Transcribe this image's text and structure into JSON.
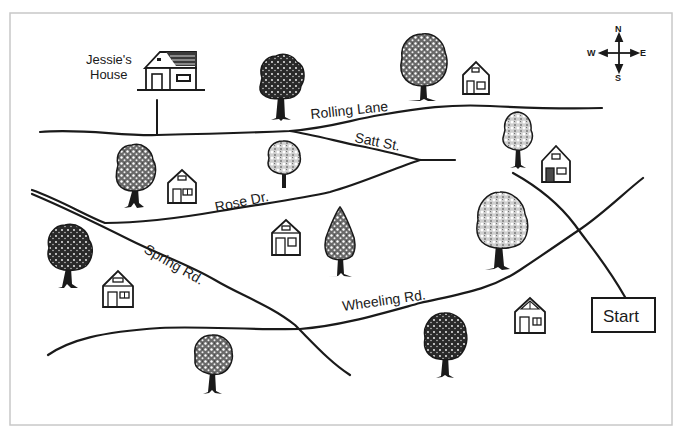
{
  "map": {
    "frame": {
      "x": 10,
      "y": 13,
      "width": 662,
      "height": 412,
      "border_color": "#c8c8c8"
    },
    "ink_color": "#1a1a1a",
    "compass": {
      "cx": 619,
      "cy": 53,
      "north": "N",
      "south": "S",
      "east": "E",
      "west": "W"
    },
    "start": {
      "label": "Start",
      "x": 592,
      "y": 298,
      "width": 63,
      "height": 34
    },
    "destination": {
      "label_line1": "Jessie's",
      "label_line2": "House"
    },
    "roads": [
      {
        "name": "Rolling Lane",
        "label": "Rolling Lane"
      },
      {
        "name": "Satt St.",
        "label": "Satt St."
      },
      {
        "name": "Rose Dr.",
        "label": "Rose Dr."
      },
      {
        "name": "Spring Rd.",
        "label": "Spring Rd."
      },
      {
        "name": "Wheeling Rd.",
        "label": "Wheeling Rd."
      }
    ],
    "houses": [
      {
        "id": "jessies-house",
        "x": 145,
        "y": 52,
        "w": 52,
        "h": 38,
        "style": "large"
      },
      {
        "id": "house-1",
        "x": 463,
        "y": 62,
        "w": 26,
        "h": 32
      },
      {
        "id": "house-2",
        "x": 542,
        "y": 146,
        "w": 28,
        "h": 36
      },
      {
        "id": "house-3",
        "x": 168,
        "y": 170,
        "w": 28,
        "h": 33
      },
      {
        "id": "house-4",
        "x": 272,
        "y": 220,
        "w": 28,
        "h": 35
      },
      {
        "id": "house-5",
        "x": 103,
        "y": 271,
        "w": 30,
        "h": 36
      },
      {
        "id": "house-6",
        "x": 515,
        "y": 298,
        "w": 30,
        "h": 35
      }
    ],
    "trees": [
      {
        "id": "tree-1",
        "x": 281,
        "y": 78,
        "r": 23,
        "trunk": 42,
        "shade": "dark"
      },
      {
        "id": "tree-2",
        "x": 424,
        "y": 62,
        "r": 24,
        "trunk": 40,
        "shade": "mixed"
      },
      {
        "id": "tree-3",
        "x": 518,
        "y": 134,
        "r": 16,
        "trunk": 34,
        "shade": "light"
      },
      {
        "id": "tree-4",
        "x": 137,
        "y": 167,
        "r": 21,
        "trunk": 40,
        "shade": "mixed"
      },
      {
        "id": "tree-5",
        "x": 284,
        "y": 158,
        "r": 17,
        "trunk": 30,
        "shade": "light"
      },
      {
        "id": "tree-6",
        "x": 501,
        "y": 222,
        "r": 26,
        "trunk": 46,
        "shade": "light"
      },
      {
        "id": "tree-7",
        "x": 340,
        "y": 240,
        "r": 16,
        "trunk": 36,
        "shade": "pine"
      },
      {
        "id": "tree-8",
        "x": 69,
        "y": 249,
        "r": 23,
        "trunk": 38,
        "shade": "dark"
      },
      {
        "id": "tree-9",
        "x": 445,
        "y": 337,
        "r": 21,
        "trunk": 40,
        "shade": "dark"
      },
      {
        "id": "tree-10",
        "x": 213,
        "y": 357,
        "r": 19,
        "trunk": 35,
        "shade": "mixed"
      }
    ]
  }
}
